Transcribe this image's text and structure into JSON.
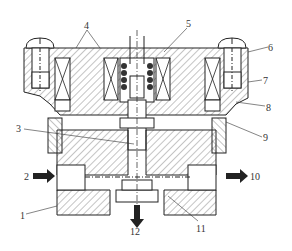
{
  "diagram": {
    "type": "cross-section technical drawing (solenoid valve)",
    "callouts": [
      {
        "id": "1",
        "text": "1"
      },
      {
        "id": "2",
        "text": "2"
      },
      {
        "id": "3",
        "text": "3"
      },
      {
        "id": "4",
        "text": "4"
      },
      {
        "id": "5",
        "text": "5"
      },
      {
        "id": "6",
        "text": "6"
      },
      {
        "id": "7",
        "text": "7"
      },
      {
        "id": "8",
        "text": "8"
      },
      {
        "id": "9",
        "text": "9"
      },
      {
        "id": "10",
        "text": "10"
      },
      {
        "id": "11",
        "text": "11"
      },
      {
        "id": "12",
        "text": "12"
      }
    ],
    "flow_arrows": [
      {
        "label": "2",
        "direction": "in-right"
      },
      {
        "label": "10",
        "direction": "out-right"
      },
      {
        "label": "12",
        "direction": "out-down"
      }
    ],
    "colors": {
      "ink": "#222222",
      "hatch": "#555555",
      "background": "#ffffff"
    }
  }
}
